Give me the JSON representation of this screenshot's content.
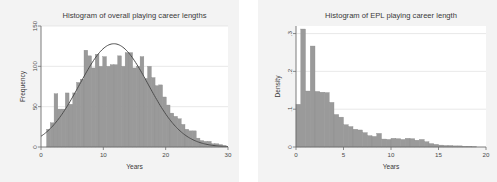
{
  "figure": {
    "background": "#ffffff",
    "panel_background": "#f3f3f3",
    "plot_background": "#ffffff",
    "bar_color": "#9a9a9a",
    "bar_edge_color": "#8c8c8c",
    "curve_color": "#4d4d4d",
    "axis_color": "#6e6e6e",
    "grid_color": "#e0e0e0"
  },
  "chart_data": [
    {
      "id": "overall-career-histogram",
      "type": "bar",
      "title": "Histogram of overall playing career lengths",
      "xlabel": "Years",
      "ylabel": "Frequency",
      "xlim": [
        0,
        30
      ],
      "ylim": [
        0,
        150
      ],
      "xticks": [
        0,
        10,
        20,
        30
      ],
      "xticklabels": [
        "0",
        "10",
        "20",
        "30"
      ],
      "yticks": [
        0,
        50,
        100,
        150
      ],
      "yticklabels": [
        "0",
        "50",
        "100",
        "150"
      ],
      "grid": true,
      "grid_axis": "y",
      "bin_width": 0.6,
      "bin_starts": [
        0.9,
        1.5,
        2.1,
        2.7,
        3.3,
        3.9,
        4.5,
        5.1,
        5.7,
        6.3,
        6.9,
        7.5,
        8.1,
        8.7,
        9.3,
        9.9,
        10.5,
        11.1,
        11.7,
        12.3,
        12.9,
        13.5,
        14.1,
        14.7,
        15.3,
        15.9,
        16.5,
        17.1,
        17.7,
        18.3,
        18.9,
        19.5,
        20.1,
        20.7,
        21.3,
        21.9,
        22.5,
        23.1,
        23.7,
        24.3,
        24.9,
        25.5,
        26.1,
        26.7,
        27.3,
        27.9,
        28.5,
        29.1
      ],
      "values": [
        22,
        30,
        66,
        47,
        47,
        67,
        53,
        67,
        80,
        84,
        120,
        113,
        98,
        115,
        100,
        112,
        100,
        102,
        102,
        113,
        100,
        117,
        117,
        98,
        100,
        112,
        85,
        100,
        86,
        76,
        77,
        62,
        52,
        42,
        38,
        35,
        28,
        22,
        20,
        20,
        11,
        8,
        7,
        7,
        4,
        4,
        3,
        2
      ],
      "overlay": {
        "name": "normal-density-curve",
        "type": "line",
        "mean": 11.7,
        "sd": 5.5,
        "peak_value": 128,
        "color": "#4d4d4d"
      }
    },
    {
      "id": "epl-career-histogram",
      "type": "bar",
      "title": "Histogram of EPL playing career length",
      "xlabel": "Years",
      "ylabel": "Density",
      "xlim": [
        0,
        20
      ],
      "ylim": [
        0,
        0.32
      ],
      "xticks": [
        0,
        5,
        10,
        15,
        20
      ],
      "xticklabels": [
        "0",
        "5",
        "10",
        "15",
        "20"
      ],
      "yticks": [
        0,
        0.1,
        0.2,
        0.3
      ],
      "yticklabels": [
        "0",
        ".1",
        ".2",
        ".3"
      ],
      "grid": true,
      "grid_axis": "y",
      "bin_width": 0.5,
      "bin_starts": [
        0.0,
        0.5,
        1.0,
        1.5,
        2.0,
        2.5,
        3.0,
        3.5,
        4.0,
        4.5,
        5.0,
        5.5,
        6.0,
        6.5,
        7.0,
        7.5,
        8.0,
        8.5,
        9.0,
        9.5,
        10.0,
        10.5,
        11.0,
        11.5,
        12.0,
        12.5,
        13.0,
        13.5,
        14.0,
        14.5,
        15.0,
        15.5,
        16.0,
        16.5,
        17.0,
        17.5,
        18.0,
        18.5
      ],
      "values": [
        0.113,
        0.312,
        0.148,
        0.267,
        0.147,
        0.145,
        0.144,
        0.118,
        0.086,
        0.079,
        0.059,
        0.054,
        0.047,
        0.045,
        0.038,
        0.03,
        0.028,
        0.036,
        0.021,
        0.02,
        0.023,
        0.022,
        0.02,
        0.023,
        0.022,
        0.018,
        0.02,
        0.014,
        0.009,
        0.007,
        0.005,
        0.004,
        0.004,
        0.003,
        0.003,
        0.002,
        0.002,
        0.001
      ]
    }
  ]
}
